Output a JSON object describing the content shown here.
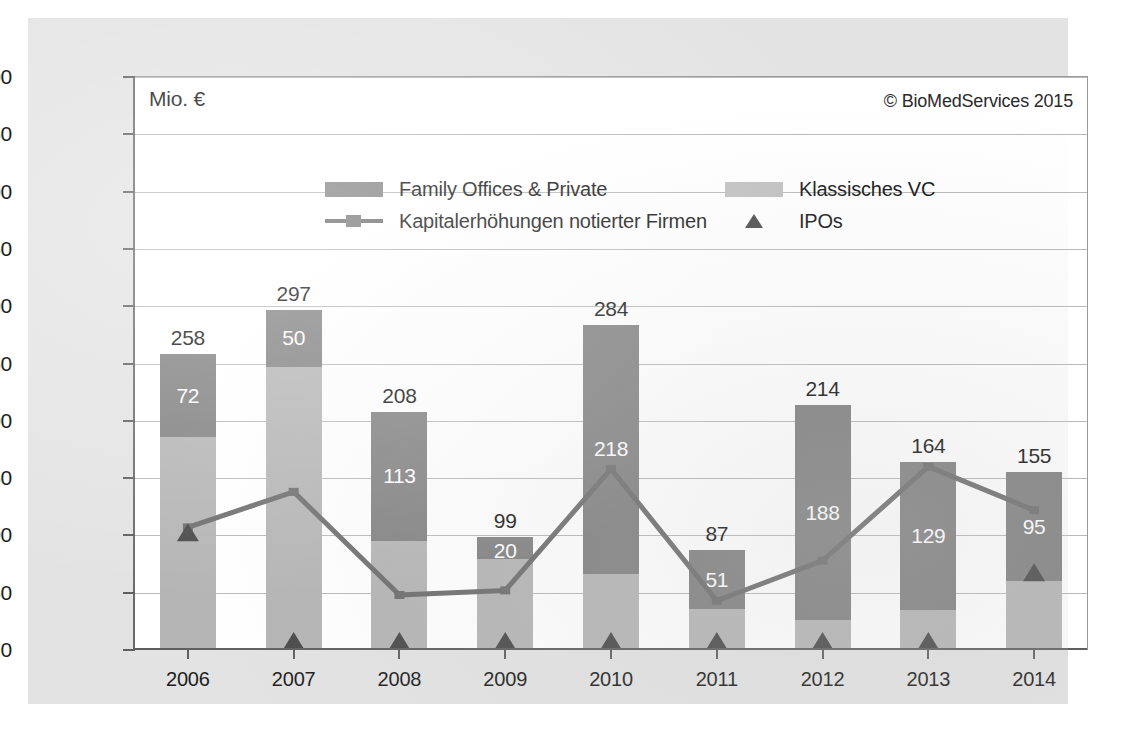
{
  "chart_data": {
    "type": "bar",
    "title": "",
    "unit_label": "Mio. €",
    "copyright": "© BioMedServices 2015",
    "xlabel": "",
    "ylabel": "Mio. €",
    "ylim": [
      0,
      500
    ],
    "ytick_step": 50,
    "yticks": [
      0,
      50,
      100,
      150,
      200,
      250,
      300,
      350,
      400,
      450,
      500
    ],
    "ytick_labels": [
      "0",
      "50",
      "100",
      "150",
      "200",
      "250",
      "300",
      "350",
      "400",
      "450",
      "500"
    ],
    "grid": true,
    "legend_position": "inside-top-center",
    "stacked": true,
    "categories": [
      "2006",
      "2007",
      "2008",
      "2009",
      "2010",
      "2011",
      "2012",
      "2013",
      "2014"
    ],
    "series": [
      {
        "name": "Klassisches VC",
        "kind": "bar-segment",
        "color": "#b5b5b5",
        "values": [
          186,
          247,
          95,
          79,
          66,
          36,
          26,
          35,
          60
        ],
        "labels": [
          "",
          "",
          "",
          "",
          "",
          "",
          "",
          "",
          ""
        ]
      },
      {
        "name": "Family Offices & Private",
        "kind": "bar-segment",
        "color": "#818181",
        "values": [
          72,
          50,
          113,
          20,
          218,
          51,
          188,
          129,
          95
        ],
        "labels": [
          "72",
          "50",
          "113",
          "20",
          "218",
          "51",
          "188",
          "129",
          "95"
        ]
      },
      {
        "name": "Kapitalerhöhungen notierter Firmen",
        "kind": "line",
        "color": "#6e6e6e",
        "values": [
          107,
          138,
          48,
          52,
          158,
          43,
          78,
          160,
          122
        ]
      },
      {
        "name": "IPOs",
        "kind": "marker",
        "color": "#4a4a4a",
        "values": [
          95,
          0,
          0,
          0,
          0,
          0,
          0,
          0,
          60
        ]
      }
    ],
    "totals": [
      258,
      297,
      208,
      99,
      284,
      87,
      214,
      164,
      155
    ],
    "total_labels": [
      "258",
      "297",
      "208",
      "99",
      "284",
      "87",
      "214",
      "164",
      "155"
    ]
  },
  "legend": {
    "items": [
      {
        "label": "Family Offices & Private",
        "marker": "box-dark",
        "color": "#858585"
      },
      {
        "label": "Klassisches VC",
        "marker": "box-light",
        "color": "#c0c0c0"
      },
      {
        "label": "Kapitalerhöhungen notierter Firmen",
        "marker": "line-square",
        "color": "#6e6e6e"
      },
      {
        "label": "IPOs",
        "marker": "triangle",
        "color": "#4a4a4a"
      }
    ]
  },
  "colors": {
    "family_offices": "#818181",
    "klassisches_vc": "#b5b5b5",
    "line": "#6e6e6e",
    "ipo_marker": "#4a4a4a",
    "plot_background": "#ffffff",
    "panel_background": "#e3e3e3",
    "gridline": "#b9b9b9",
    "axis": "#5f5f5f",
    "text": "#1d1d1d"
  }
}
